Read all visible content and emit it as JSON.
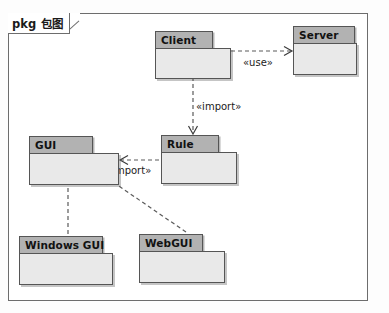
{
  "diagram": {
    "frame_label": "pkg 包图",
    "type": "uml-package-diagram",
    "accent_header_color": "#b2b2b2",
    "body_color": "#e9e9e9",
    "border_color": "#555555",
    "line_color": "#5a5a5a"
  },
  "packages": [
    {
      "id": "client",
      "name": "Client",
      "x": 155,
      "y": 31,
      "tab_w": 58,
      "body_w": 76,
      "body_h": 31
    },
    {
      "id": "server",
      "name": "Server",
      "x": 293,
      "y": 26,
      "tab_w": 62,
      "body_w": 64,
      "body_h": 32
    },
    {
      "id": "gui",
      "name": "GUI",
      "x": 29,
      "y": 136,
      "tab_w": 64,
      "body_w": 90,
      "body_h": 32
    },
    {
      "id": "rule",
      "name": "Rule",
      "x": 161,
      "y": 135,
      "tab_w": 58,
      "body_w": 76,
      "body_h": 32
    },
    {
      "id": "windows_gui",
      "name": "Windows GUI",
      "x": 19,
      "y": 236,
      "tab_w": 84,
      "body_w": 94,
      "body_h": 32
    },
    {
      "id": "webgui",
      "name": "WebGUI",
      "x": 139,
      "y": 234,
      "tab_w": 64,
      "body_w": 86,
      "body_h": 32
    }
  ],
  "relationships": [
    {
      "id": "client-uses-server",
      "from": "client",
      "to": "server",
      "kind": "dependency",
      "label": "«use»",
      "label_x": 243,
      "label_y": 57
    },
    {
      "id": "client-imports-rule",
      "from": "client",
      "to": "rule",
      "kind": "dependency",
      "label": "«import»",
      "label_x": 196,
      "label_y": 101
    },
    {
      "id": "rule-imports-gui",
      "from": "rule",
      "to": "gui",
      "kind": "dependency",
      "label": "«import»",
      "label_x": 106,
      "label_y": 165
    },
    {
      "id": "windowsgui-generalizes-gui",
      "from": "windows_gui",
      "to": "gui",
      "kind": "generalization",
      "label": "",
      "label_x": 0,
      "label_y": 0
    },
    {
      "id": "webgui-generalizes-gui",
      "from": "webgui",
      "to": "gui",
      "kind": "generalization",
      "label": "",
      "label_x": 0,
      "label_y": 0
    }
  ]
}
